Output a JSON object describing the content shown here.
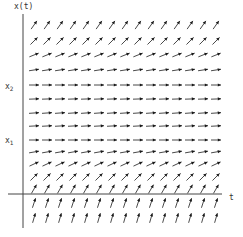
{
  "figure": {
    "type": "slope-field",
    "axes": {
      "y_label": "x(t)",
      "x_label": "t",
      "equilibria_labels": [
        {
          "name": "x",
          "subscript": "2"
        },
        {
          "name": "x",
          "subscript": "1"
        }
      ]
    },
    "colors": {
      "arrow": "#1a1a1a",
      "axis": "#444444",
      "text": "#333333"
    },
    "grid": {
      "columns_x": [
        34,
        47,
        60,
        73,
        86,
        99,
        112,
        125,
        138,
        151,
        164,
        177,
        190,
        203,
        216
      ],
      "rows": [
        {
          "y": 25,
          "angle": 55
        },
        {
          "y": 41,
          "angle": 45
        },
        {
          "y": 55,
          "angle": 22
        },
        {
          "y": 70,
          "angle": 9
        },
        {
          "y": 85,
          "angle": 0
        },
        {
          "y": 99,
          "angle": 2
        },
        {
          "y": 113,
          "angle": 4
        },
        {
          "y": 126,
          "angle": 3
        },
        {
          "y": 140,
          "angle": 0
        },
        {
          "y": 152,
          "angle": 10
        },
        {
          "y": 164,
          "angle": 25
        },
        {
          "y": 177,
          "angle": 45
        },
        {
          "y": 189,
          "angle": 60
        },
        {
          "y": 203,
          "angle": 72
        },
        {
          "y": 218,
          "angle": 74
        }
      ],
      "arrow_length": 10
    }
  }
}
